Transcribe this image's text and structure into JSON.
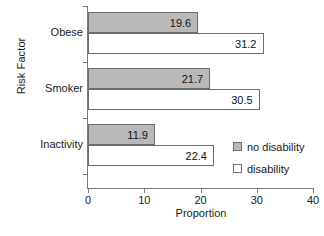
{
  "chart_data": {
    "type": "bar",
    "orientation": "horizontal",
    "title": "",
    "xlabel": "Proportion",
    "ylabel": "Risk Factor",
    "categories": [
      "Obese",
      "Smoker",
      "Inactivity"
    ],
    "series": [
      {
        "name": "no disability",
        "color": "#b9b9b9",
        "values": [
          19.6,
          21.7,
          11.9
        ]
      },
      {
        "name": "disability",
        "color": "#ffffff",
        "values": [
          31.2,
          30.5,
          22.4
        ]
      }
    ],
    "xlim": [
      0,
      40
    ],
    "xticks": [
      0,
      10,
      20,
      30,
      40
    ],
    "xtick_labels": [
      "0",
      "10",
      "20",
      "30",
      "40"
    ],
    "grid": false,
    "legend_position": "bottom-right",
    "value_labels_shown": true,
    "value_labels": {
      "Obese": {
        "no disability": "19.6",
        "disability": "31.2"
      },
      "Smoker": {
        "no disability": "21.7",
        "disability": "30.5"
      },
      "Inactivity": {
        "no disability": "11.9",
        "disability": "22.4"
      }
    },
    "axis_color": "#7a7a7a",
    "bar_border_color": "#6e6e6e"
  }
}
